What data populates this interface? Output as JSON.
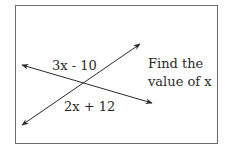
{
  "diagram": {
    "type": "intersecting-lines-angle-problem",
    "angles": {
      "top": "3x - 10",
      "bottom": "2x + 12"
    },
    "prompt": {
      "line1": "Find the",
      "line2": "value of x"
    },
    "colors": {
      "border": "#6b6b6b",
      "line": "#2a2a2a",
      "text": "#2a2a2a",
      "background": "#ffffff"
    }
  }
}
